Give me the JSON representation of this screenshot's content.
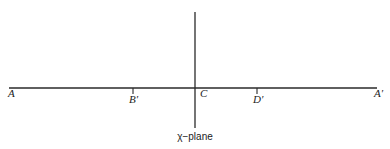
{
  "diagram": {
    "caption": "χ−plane",
    "colors": {
      "line": "#2a2a2a",
      "text": "#222222",
      "background": "#ffffff"
    },
    "horizontal_axis": {
      "x1": 9,
      "x2": 377,
      "y": 88
    },
    "vertical_axis": {
      "x": 195,
      "y1": 12,
      "y2": 128
    },
    "points": [
      {
        "id": "A",
        "label": "A",
        "x": 9,
        "tick": false
      },
      {
        "id": "B-prime",
        "label": "B′",
        "x": 133,
        "tick": true
      },
      {
        "id": "C",
        "label": "C",
        "x": 195,
        "tick": false
      },
      {
        "id": "D-prime",
        "label": "D′",
        "x": 257,
        "tick": true
      },
      {
        "id": "A-prime",
        "label": "A′",
        "x": 377,
        "tick": false
      }
    ]
  }
}
